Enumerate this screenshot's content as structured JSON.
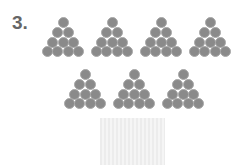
{
  "problem": {
    "number_label": "3.",
    "groups_row1": 4,
    "groups_row2": 3,
    "circles_per_group": 10,
    "triangle_rows": [
      1,
      2,
      3,
      4
    ],
    "circle_color": "#8a8a8a",
    "answer_box": {
      "color": "#efefef",
      "content": ""
    }
  }
}
